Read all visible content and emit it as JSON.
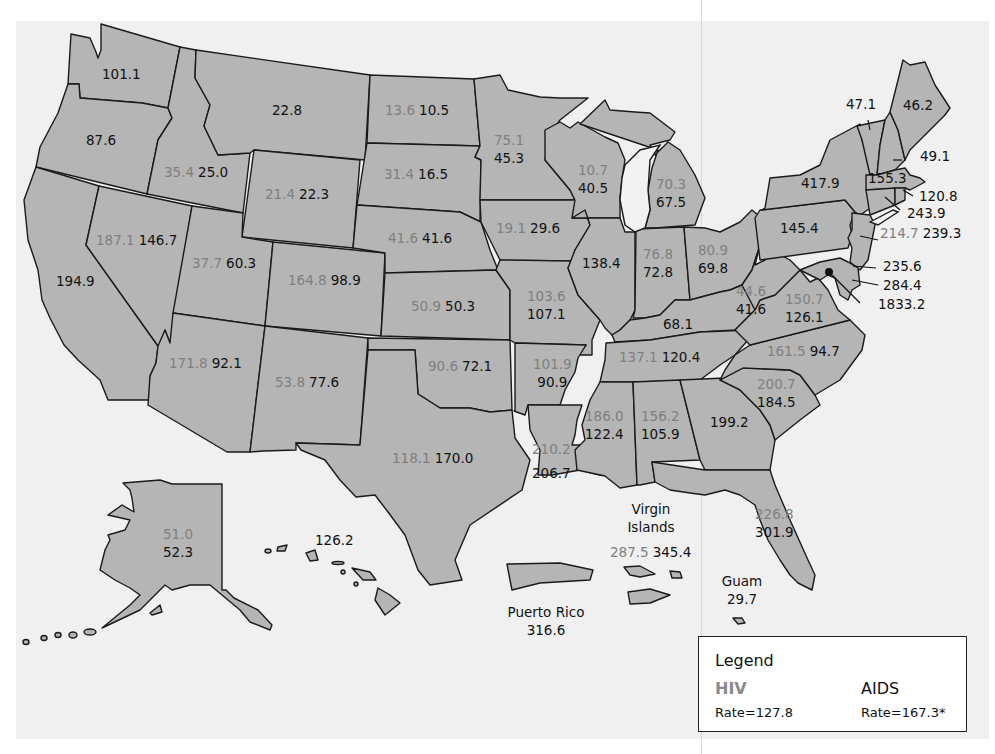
{
  "legend": {
    "title": "Legend",
    "hiv_label": "HIV",
    "hiv_rate": "Rate=127.8",
    "aids_label": "AIDS",
    "aids_rate": "Rate=167.3*",
    "hiv_color": "#808080",
    "aids_color": "#111111"
  },
  "colors": {
    "land": "#b5b5b5",
    "water": "#f0f0f0",
    "border": "#1a1a1a"
  },
  "states": {
    "WA": {
      "aids": "101.1"
    },
    "OR": {
      "aids": "87.6"
    },
    "CA": {
      "aids": "194.9"
    },
    "MT": {
      "aids": "22.8"
    },
    "ID": {
      "hiv": "35.4",
      "aids": "25.0"
    },
    "WY": {
      "hiv": "21.4",
      "aids": "22.3"
    },
    "NV": {
      "hiv": "187.1",
      "aids": "146.7"
    },
    "UT": {
      "hiv": "37.7",
      "aids": "60.3"
    },
    "CO": {
      "hiv": "164.8",
      "aids": "98.9"
    },
    "AZ": {
      "hiv": "171.8",
      "aids": "92.1"
    },
    "NM": {
      "hiv": "53.8",
      "aids": "77.6"
    },
    "ND": {
      "hiv": "13.6",
      "aids": "10.5"
    },
    "SD": {
      "hiv": "31.4",
      "aids": "16.5"
    },
    "NE": {
      "hiv": "41.6",
      "aids": "41.6"
    },
    "KS": {
      "hiv": "50.9",
      "aids": "50.3"
    },
    "OK": {
      "hiv": "90.6",
      "aids": "72.1"
    },
    "TX": {
      "hiv": "118.1",
      "aids": "170.0"
    },
    "MN": {
      "hiv": "75.1",
      "aids": "45.3"
    },
    "IA": {
      "hiv": "19.1",
      "aids": "29.6"
    },
    "MO": {
      "hiv": "103.6",
      "aids": "107.1"
    },
    "AR": {
      "hiv": "101.9",
      "aids": "90.9"
    },
    "LA": {
      "hiv": "210.2",
      "aids": "206.7"
    },
    "WI": {
      "hiv": "10.7",
      "aids": "40.5"
    },
    "IL": {
      "aids": "138.4"
    },
    "MI": {
      "hiv": "70.3",
      "aids": "67.5"
    },
    "IN": {
      "hiv": "76.8",
      "aids": "72.8"
    },
    "OH": {
      "hiv": "80.9",
      "aids": "69.8"
    },
    "KY": {
      "aids": "68.1"
    },
    "TN": {
      "hiv": "137.1",
      "aids": "120.4"
    },
    "MS": {
      "hiv": "186.0",
      "aids": "122.4"
    },
    "AL": {
      "hiv": "156.2",
      "aids": "105.9"
    },
    "GA": {
      "aids": "199.2"
    },
    "FL": {
      "hiv": "226.8",
      "aids": "301.9"
    },
    "SC": {
      "hiv": "200.7",
      "aids": "184.5"
    },
    "NC": {
      "hiv": "161.5",
      "aids": "94.7"
    },
    "VA": {
      "hiv": "150.7",
      "aids": "126.1"
    },
    "WV": {
      "hiv": "44.6",
      "aids": "41.6"
    },
    "PA": {
      "aids": "145.4"
    },
    "NY": {
      "aids": "417.9"
    },
    "VT": {
      "aids": "47.1"
    },
    "ME": {
      "aids": "46.2"
    },
    "NH": {
      "aids": "49.1"
    },
    "MA": {
      "aids": "155.3"
    },
    "RI": {
      "aids": "120.8"
    },
    "CT": {
      "aids": "243.9"
    },
    "NJ": {
      "hiv": "214.7",
      "aids": "239.3"
    },
    "DE": {
      "aids": "235.6"
    },
    "MD": {
      "aids": "284.4"
    },
    "DC": {
      "aids": "1833.2"
    },
    "AK": {
      "hiv": "51.0",
      "aids": "52.3"
    },
    "HI": {
      "aids": "126.2"
    }
  },
  "territories": {
    "virgin_islands": {
      "name_line1": "Virgin",
      "name_line2": "Islands",
      "hiv": "287.5",
      "aids": "345.4"
    },
    "puerto_rico": {
      "name": "Puerto Rico",
      "aids": "316.6"
    },
    "guam": {
      "name": "Guam",
      "aids": "29.7"
    }
  }
}
